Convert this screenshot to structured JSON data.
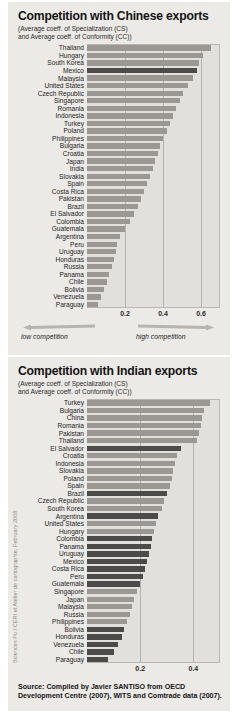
{
  "credit": "Sciences Po / CERI et Atelier de cartographie, February 2008",
  "source": "Source: Compiled by Javier SANTISO from OECD Development Centre (2007), WITS and Comtrade data (2007).",
  "legend": {
    "low": "low competition",
    "high": "high competition"
  },
  "chart_data": [
    {
      "type": "bar",
      "orientation": "horizontal",
      "title": "Competition with Chinese exports",
      "subtitle_line1": "(Average coeff. of Specialization (CS)",
      "subtitle_line2": "and Average coeff. of Conformity (CC))",
      "xlabel": "",
      "ylabel": "",
      "xlim": [
        0,
        0.7
      ],
      "ticks": [
        0.2,
        0.4,
        0.6
      ],
      "tick_labels": [
        "0.2",
        "0.4",
        "0.6"
      ],
      "grid": true,
      "legend_position": "below-axis",
      "highlighted": [
        "Mexico"
      ],
      "categories": [
        "Thailand",
        "Hungary",
        "South Korea",
        "Mexico",
        "Malaysia",
        "United States",
        "Czech Republic",
        "Singapore",
        "Romania",
        "Indonesia",
        "Turkey",
        "Poland",
        "Philippines",
        "Bulgaria",
        "Croatia",
        "Japan",
        "India",
        "Slovakia",
        "Spain",
        "Costa Rica",
        "Pakistan",
        "Brazil",
        "El Salvador",
        "Colombia",
        "Guatemala",
        "Argentina",
        "Peru",
        "Uruguay",
        "Honduras",
        "Russia",
        "Panama",
        "Chile",
        "Bolivia",
        "Venezuela",
        "Paraguay"
      ],
      "values": [
        0.65,
        0.61,
        0.59,
        0.58,
        0.56,
        0.53,
        0.505,
        0.49,
        0.47,
        0.455,
        0.435,
        0.42,
        0.4,
        0.385,
        0.375,
        0.36,
        0.345,
        0.33,
        0.315,
        0.3,
        0.285,
        0.27,
        0.245,
        0.225,
        0.2,
        0.175,
        0.16,
        0.15,
        0.14,
        0.13,
        0.118,
        0.105,
        0.09,
        0.075,
        0.058
      ]
    },
    {
      "type": "bar",
      "orientation": "horizontal",
      "title": "Competition with Indian exports",
      "subtitle_line1": "(Average coeff. of Specialization (CS)",
      "subtitle_line2": "and Average coeff. of Conformity (CC))",
      "xlabel": "",
      "ylabel": "",
      "xlim": [
        0,
        0.5
      ],
      "ticks": [
        0.2,
        0.4
      ],
      "tick_labels": [
        "0.2",
        "0.4"
      ],
      "grid": true,
      "legend_position": "none",
      "highlighted": [
        "El Salvador",
        "Brazil",
        "Argentina",
        "Colombia",
        "Panama",
        "Uruguay",
        "Mexico",
        "Costa Rica",
        "Peru",
        "Guatemala",
        "Bolivia",
        "Honduras",
        "Venezuela",
        "Chile",
        "Paraguay"
      ],
      "categories": [
        "Turkey",
        "Bulgaria",
        "China",
        "Romania",
        "Pakistan",
        "Thailand",
        "El Salvador",
        "Croatia",
        "Indonesia",
        "Slovakia",
        "Poland",
        "Spain",
        "Brazil",
        "Czech Republic",
        "South Korea",
        "Argentina",
        "United States",
        "Hungary",
        "Colombia",
        "Panama",
        "Uruguay",
        "Mexico",
        "Costa Rica",
        "Peru",
        "Guatemala",
        "Singapore",
        "Japan",
        "Malaysia",
        "Russia",
        "Philippines",
        "Bolivia",
        "Honduras",
        "Venezuela",
        "Chile",
        "Paraguay"
      ],
      "values": [
        0.462,
        0.44,
        0.432,
        0.428,
        0.42,
        0.412,
        0.352,
        0.34,
        0.33,
        0.322,
        0.318,
        0.312,
        0.3,
        0.29,
        0.282,
        0.268,
        0.258,
        0.252,
        0.246,
        0.24,
        0.232,
        0.226,
        0.218,
        0.21,
        0.2,
        0.188,
        0.175,
        0.168,
        0.16,
        0.15,
        0.14,
        0.13,
        0.118,
        0.102,
        0.078
      ]
    }
  ]
}
